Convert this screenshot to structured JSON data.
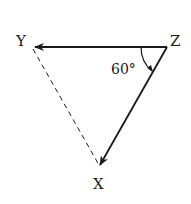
{
  "diagram": {
    "type": "vector-triangle",
    "vertices": {
      "Y": {
        "label": "Y",
        "x": 33,
        "y": 47
      },
      "Z": {
        "label": "Z",
        "x": 167,
        "y": 47
      },
      "X": {
        "label": "X",
        "x": 99,
        "y": 167
      }
    },
    "edges": [
      {
        "from": "Z",
        "to": "Y",
        "style": "solid",
        "arrow": true
      },
      {
        "from": "Z",
        "to": "X",
        "style": "solid",
        "arrow": true
      },
      {
        "from": "Y",
        "to": "X",
        "style": "dashed",
        "arrow": false
      }
    ],
    "angle": {
      "vertex": "Z",
      "label": "60°",
      "value": 60
    },
    "colors": {
      "line": "#1a1a1a",
      "background": "#ffffff"
    }
  }
}
